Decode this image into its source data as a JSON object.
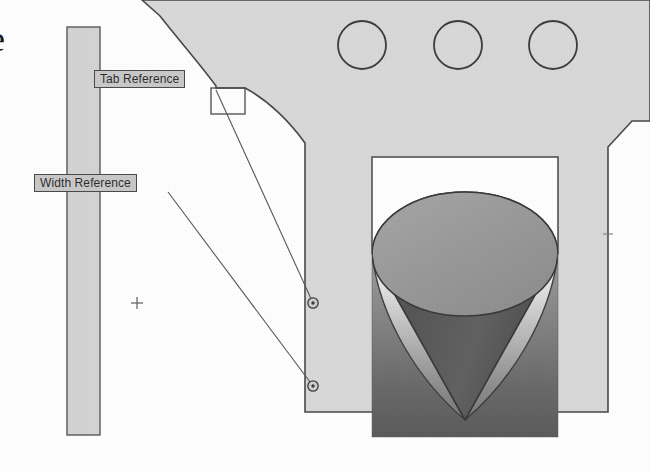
{
  "drawing": {
    "title": "Tab and Width Reference Callout Drawing",
    "background_color": "#ffffff",
    "body_fill": "#d9d9d9",
    "outline_color": "#4a4a4a",
    "callout_fill": "#c9c9c9",
    "callout_border": "#4a4a4a",
    "clipped_edge_glyph": "e"
  },
  "callouts": [
    {
      "id": "tab-reference",
      "label": "Tab Reference",
      "x": 94,
      "y": 70,
      "leader_from": [
        216,
        88
      ],
      "leader_to": [
        313,
        303
      ],
      "marker": "circle-dot"
    },
    {
      "id": "width-reference",
      "label": "Width Reference",
      "x": 34,
      "y": 174,
      "leader_from": [
        168,
        192
      ],
      "leader_to": [
        313,
        386
      ],
      "marker": "circle-dot"
    }
  ],
  "holes": {
    "name": "circular-holes",
    "count": 3,
    "radius": 24,
    "centers": [
      [
        362,
        45
      ],
      [
        458,
        45
      ],
      [
        553,
        45
      ]
    ]
  },
  "features": {
    "tab_rect": {
      "name": "tab-feature-rectangle",
      "x": 211,
      "y": 88,
      "width": 34,
      "height": 26
    },
    "width_strip": {
      "name": "width-reference-strip",
      "x": 67,
      "y": 27,
      "width": 33,
      "height": 408
    },
    "crosshair": {
      "name": "origin-crosshair",
      "x": 137,
      "y": 303,
      "size": 11
    },
    "tick_mark": {
      "name": "edge-tick-mark",
      "x": 608,
      "y": 234,
      "size": 9
    }
  },
  "preview": {
    "name": "shaded-cone-preview",
    "white_panel": {
      "x": 372,
      "y": 157,
      "width": 186,
      "height": 97
    },
    "gradient_panel": {
      "x": 372,
      "y": 254,
      "width": 186,
      "height": 183
    },
    "cone": {
      "apex": [
        465,
        420
      ],
      "top_center": [
        465,
        254
      ],
      "top_rx": 93,
      "top_ry": 62
    },
    "gradient_top_color": "#f2f2f2",
    "gradient_bottom_color": "#6f6f6f",
    "cone_light_color": "#9a9a9a",
    "cone_dark_color": "#555555"
  }
}
